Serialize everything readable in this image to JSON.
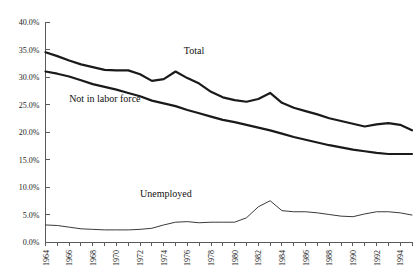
{
  "chart_data": {
    "type": "line",
    "title": "",
    "subtitle": "",
    "xlabel": "",
    "ylabel": "",
    "xlim": [
      1964,
      1995
    ],
    "ylim": [
      0,
      40
    ],
    "grid": false,
    "legend_position": "inline-annotations",
    "y_tick_labels": [
      "40.0%",
      "35.0%",
      "30.0%",
      "25.0%",
      "20.0%",
      "15.0%",
      "10.0%",
      "5.0%",
      "0.0%"
    ],
    "y_tick_values": [
      40,
      35,
      30,
      25,
      20,
      15,
      10,
      5,
      0
    ],
    "x_tick_labels": [
      "1964",
      "1966",
      "1968",
      "1970",
      "1972",
      "1974",
      "1976",
      "1978",
      "1980",
      "1982",
      "1984",
      "1986",
      "1988",
      "1990",
      "1992",
      "1994"
    ],
    "x_tick_values": [
      1964,
      1966,
      1968,
      1970,
      1972,
      1974,
      1976,
      1978,
      1980,
      1982,
      1984,
      1986,
      1988,
      1990,
      1992,
      1994
    ],
    "x": [
      1964,
      1965,
      1966,
      1967,
      1968,
      1969,
      1970,
      1971,
      1972,
      1973,
      1974,
      1975,
      1976,
      1977,
      1978,
      1979,
      1980,
      1981,
      1982,
      1983,
      1984,
      1985,
      1986,
      1987,
      1988,
      1989,
      1990,
      1991,
      1992,
      1993,
      1994,
      1995
    ],
    "series": [
      {
        "name": "Total",
        "label": "Total",
        "color": "#1a1a1a",
        "values": [
          34.5,
          33.8,
          33.0,
          32.3,
          31.8,
          31.3,
          31.2,
          31.2,
          30.5,
          29.3,
          29.6,
          31.0,
          29.8,
          28.8,
          27.3,
          26.3,
          25.8,
          25.5,
          26.0,
          27.1,
          25.3,
          24.4,
          23.8,
          23.2,
          22.5,
          22.0,
          21.5,
          21.0,
          21.4,
          21.6,
          21.3,
          20.3
        ]
      },
      {
        "name": "Not in labor force",
        "label": "Not in labor force",
        "color": "#1a1a1a",
        "values": [
          31.0,
          30.6,
          30.1,
          29.4,
          28.7,
          28.2,
          27.7,
          27.1,
          26.5,
          25.7,
          25.2,
          24.7,
          24.0,
          23.4,
          22.8,
          22.2,
          21.8,
          21.3,
          20.8,
          20.3,
          19.7,
          19.1,
          18.6,
          18.1,
          17.6,
          17.2,
          16.8,
          16.5,
          16.2,
          16.0,
          16.0,
          16.0
        ]
      },
      {
        "name": "Unemployed",
        "label": "Unemployed",
        "color": "#3a3a3a",
        "values": [
          3.1,
          3.0,
          2.7,
          2.4,
          2.3,
          2.2,
          2.2,
          2.2,
          2.3,
          2.5,
          3.1,
          3.6,
          3.7,
          3.5,
          3.6,
          3.6,
          3.6,
          4.4,
          6.4,
          7.5,
          5.7,
          5.5,
          5.5,
          5.3,
          5.0,
          4.7,
          4.6,
          5.1,
          5.5,
          5.5,
          5.3,
          4.9
        ]
      }
    ],
    "annotations": [
      {
        "name": "total-label",
        "text": "Total",
        "x": 1975.7,
        "y": 34.2
      },
      {
        "name": "not-in-labor-force-label",
        "text": "Not in labor force",
        "x": 1966.0,
        "y": 25.5
      },
      {
        "name": "unemployed-label",
        "text": "Unemployed",
        "x": 1972.0,
        "y": 8.2
      }
    ]
  }
}
